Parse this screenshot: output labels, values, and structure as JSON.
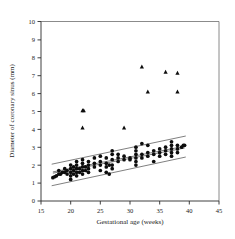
{
  "chart_data": {
    "type": "scatter",
    "title": "",
    "xlabel": "Gestational age (weeks)",
    "ylabel": "Diameter of coronary sinus (mm)",
    "xlim": [
      15,
      45
    ],
    "ylim": [
      0,
      10
    ],
    "xticks": [
      15,
      20,
      25,
      30,
      35,
      40,
      45
    ],
    "yticks": [
      0,
      1,
      2,
      3,
      4,
      5,
      6,
      7,
      8,
      9,
      10
    ],
    "grid": false,
    "legend": "none",
    "frame": "box",
    "series": [
      {
        "name": "normal-fetuses",
        "marker": "filled-circle",
        "color": "#0d0d0d",
        "points": [
          [
            17.0,
            1.3
          ],
          [
            17.3,
            1.35
          ],
          [
            17.6,
            1.4
          ],
          [
            18.0,
            1.5
          ],
          [
            18.0,
            1.7
          ],
          [
            18.3,
            1.5
          ],
          [
            18.6,
            1.6
          ],
          [
            19.0,
            1.6
          ],
          [
            19.0,
            1.8
          ],
          [
            19.4,
            1.5
          ],
          [
            19.4,
            1.7
          ],
          [
            20.0,
            1.2
          ],
          [
            20.0,
            1.4
          ],
          [
            20.0,
            1.6
          ],
          [
            20.0,
            1.8
          ],
          [
            20.0,
            2.0
          ],
          [
            20.5,
            1.5
          ],
          [
            20.5,
            1.7
          ],
          [
            20.5,
            1.9
          ],
          [
            21.0,
            1.4
          ],
          [
            21.0,
            1.6
          ],
          [
            21.0,
            1.8
          ],
          [
            21.0,
            2.0
          ],
          [
            21.0,
            2.2
          ],
          [
            21.5,
            1.6
          ],
          [
            21.5,
            1.8
          ],
          [
            22.0,
            1.5
          ],
          [
            22.0,
            1.7
          ],
          [
            22.0,
            1.9
          ],
          [
            22.0,
            2.1
          ],
          [
            22.0,
            2.3
          ],
          [
            22.5,
            1.7
          ],
          [
            22.5,
            1.9
          ],
          [
            23.0,
            1.6
          ],
          [
            23.0,
            1.8
          ],
          [
            23.0,
            2.0
          ],
          [
            23.0,
            2.2
          ],
          [
            24.0,
            1.9
          ],
          [
            24.0,
            2.1
          ],
          [
            24.0,
            2.4
          ],
          [
            25.0,
            1.7
          ],
          [
            25.0,
            2.0
          ],
          [
            25.0,
            2.2
          ],
          [
            25.0,
            2.5
          ],
          [
            26.0,
            1.6
          ],
          [
            26.0,
            1.9
          ],
          [
            26.0,
            2.1
          ],
          [
            26.0,
            2.4
          ],
          [
            26.5,
            1.5
          ],
          [
            26.5,
            2.0
          ],
          [
            27.0,
            1.8
          ],
          [
            27.0,
            2.0
          ],
          [
            27.0,
            2.3
          ],
          [
            27.0,
            2.6
          ],
          [
            27.0,
            2.8
          ],
          [
            28.0,
            2.2
          ],
          [
            28.0,
            2.4
          ],
          [
            28.0,
            2.6
          ],
          [
            29.0,
            2.3
          ],
          [
            29.0,
            2.5
          ],
          [
            30.0,
            2.3
          ],
          [
            30.0,
            2.4
          ],
          [
            31.0,
            2.0
          ],
          [
            31.0,
            2.2
          ],
          [
            31.0,
            2.4
          ],
          [
            31.0,
            2.6
          ],
          [
            31.0,
            2.8
          ],
          [
            31.0,
            3.0
          ],
          [
            32.0,
            2.4
          ],
          [
            32.0,
            2.6
          ],
          [
            32.0,
            3.2
          ],
          [
            33.0,
            2.5
          ],
          [
            33.0,
            2.7
          ],
          [
            33.0,
            3.1
          ],
          [
            34.0,
            2.2
          ],
          [
            34.0,
            2.6
          ],
          [
            34.0,
            2.8
          ],
          [
            35.0,
            2.5
          ],
          [
            35.0,
            2.7
          ],
          [
            35.0,
            2.9
          ],
          [
            36.0,
            2.6
          ],
          [
            36.0,
            2.8
          ],
          [
            36.0,
            3.0
          ],
          [
            37.0,
            2.5
          ],
          [
            37.0,
            2.7
          ],
          [
            37.0,
            2.9
          ],
          [
            37.0,
            3.1
          ],
          [
            37.0,
            3.3
          ],
          [
            38.0,
            2.7
          ],
          [
            38.0,
            2.9
          ],
          [
            38.0,
            3.1
          ],
          [
            38.7,
            3.0
          ],
          [
            39.0,
            3.1
          ],
          [
            39.2,
            3.1
          ]
        ]
      },
      {
        "name": "affected-fetuses-outliers",
        "marker": "filled-triangle",
        "color": "#0d0d0d",
        "points": [
          [
            22.0,
            5.05
          ],
          [
            22.2,
            5.05
          ],
          [
            22.0,
            4.1
          ],
          [
            29.0,
            4.1
          ],
          [
            32.0,
            7.5
          ],
          [
            33.0,
            6.1
          ],
          [
            36.0,
            7.2
          ],
          [
            38.0,
            7.15
          ],
          [
            38.0,
            6.1
          ]
        ]
      }
    ],
    "reference_lines": [
      {
        "name": "regression-line",
        "from": [
          17.0,
          1.55
        ],
        "to": [
          39.2,
          2.95
        ]
      },
      {
        "name": "upper-inner-band",
        "from": [
          17.0,
          1.62
        ],
        "to": [
          39.2,
          3.05
        ]
      },
      {
        "name": "upper-outer-band",
        "from": [
          16.8,
          2.05
        ],
        "to": [
          39.4,
          3.62
        ]
      },
      {
        "name": "lower-outer-band",
        "from": [
          16.8,
          0.85
        ],
        "to": [
          39.4,
          2.45
        ]
      }
    ]
  },
  "axes": {
    "x": {
      "title": "Gestational age (weeks)",
      "tick_labels": [
        "15",
        "20",
        "25",
        "30",
        "35",
        "40",
        "45"
      ]
    },
    "y": {
      "title": "Diameter of coronary sinus (mm)",
      "tick_labels": [
        "0",
        "1",
        "2",
        "3",
        "4",
        "5",
        "6",
        "7",
        "8",
        "9",
        "10"
      ]
    }
  }
}
